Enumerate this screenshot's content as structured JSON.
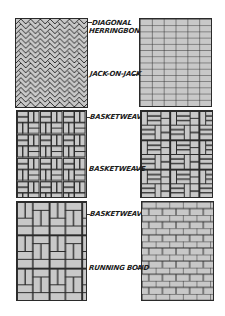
{
  "figure": {
    "colors": {
      "brick": "#c8c8c8",
      "mortar": "#2a2a2a",
      "background": "#ffffff",
      "label": "#1c1c1c"
    },
    "panels": [
      {
        "id": "diagonal-herringbone",
        "label_lines": [
          "DIAGONAL",
          "HERRINGBONE"
        ],
        "pattern": "diagonal-herringbone",
        "side": "left",
        "row": 1
      },
      {
        "id": "jack-on-jack",
        "label_lines": [
          "JACK-ON-JACK"
        ],
        "pattern": "jack-on-jack",
        "side": "right",
        "row": 1
      },
      {
        "id": "basketweave-1",
        "label_lines": [
          "BASKETWEAVE"
        ],
        "pattern": "basketweave",
        "side": "left",
        "row": 2
      },
      {
        "id": "basketweave-2",
        "label_lines": [
          "BASKETWEAVE"
        ],
        "pattern": "basketweave-stepped",
        "side": "right",
        "row": 2
      },
      {
        "id": "basketweave-3",
        "label_lines": [
          "BASKETWEAVE"
        ],
        "pattern": "basketweave-vertical",
        "side": "left",
        "row": 3
      },
      {
        "id": "running-bond",
        "label_lines": [
          "RUNNING BOND"
        ],
        "pattern": "running-bond",
        "side": "right",
        "row": 3
      }
    ]
  }
}
